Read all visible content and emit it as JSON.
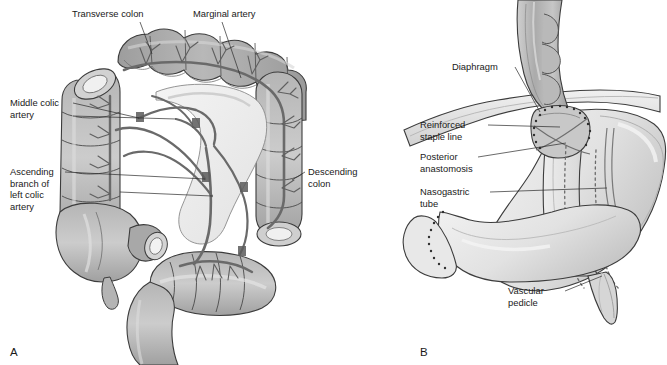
{
  "figure": {
    "background": "#ffffff",
    "ink": "#1a1a1a",
    "type": "medical-anatomical-illustration",
    "style": "grayscale line art, two panels",
    "palette": {
      "bowel_fill": "#a9a9a9",
      "bowel_fill_light": "#c3c3c3",
      "bowel_highlight": "#d8d8d8",
      "lumen": "#efefef",
      "vessel": "#6f6f6f",
      "vessel_dark": "#555555",
      "outline": "#3c3c3c",
      "stomach_fill": "#e6e6e6",
      "stomach_shade": "#c8c8c8",
      "esophagus_fill": "#b4b4b4",
      "leader_line": "#2a2a2a"
    }
  },
  "panels": [
    {
      "id": "A",
      "letter": "A",
      "letter_x": 10,
      "letter_y": 356,
      "subject": "colon-vascular-anatomy",
      "labels": [
        {
          "id": "transverse-colon",
          "lines": [
            "Transverse colon"
          ],
          "text_x": 72,
          "text_y": 17,
          "leader": "M 140 22 L 152 54"
        },
        {
          "id": "marginal-artery",
          "lines": [
            "Marginal artery"
          ],
          "text_x": 193,
          "text_y": 17,
          "leader": "M 222 22 L 241 78"
        },
        {
          "id": "middle-colic-artery",
          "lines": [
            "Middle colic",
            "artery"
          ],
          "text_x": 10,
          "text_y": 106,
          "leader": "M 73 103 L 139 118"
        },
        {
          "id": "middle-colic-artery-second",
          "lines": [],
          "text_x": 0,
          "text_y": 0,
          "leader": "M 73 116 L 176 119"
        },
        {
          "id": "ascending-branch-left-colic-artery",
          "lines": [
            "Ascending",
            "branch of",
            "left colic",
            "artery"
          ],
          "text_x": 10,
          "text_y": 175,
          "leader": "M 65 172 L 205 179"
        },
        {
          "id": "ascending-branch-left-colic-artery-second",
          "lines": [],
          "text_x": 0,
          "text_y": 0,
          "leader": "M 120 192 L 212 196"
        },
        {
          "id": "descending-colon",
          "lines": [
            "Descending",
            "colon"
          ],
          "text_x": 308,
          "text_y": 175,
          "leader": "M 305 172 L 292 180"
        }
      ]
    },
    {
      "id": "B",
      "letter": "B",
      "letter_x": 420,
      "letter_y": 356,
      "subject": "gastric-conduit-esophagogastric-anastomosis",
      "labels": [
        {
          "id": "diaphragm",
          "lines": [
            "Diaphragm"
          ],
          "text_x": 452,
          "text_y": 70,
          "leader": "M 515 67 L 540 112"
        },
        {
          "id": "reinforced-staple-line",
          "lines": [
            "Reinforced",
            "staple line"
          ],
          "text_x": 420,
          "text_y": 128,
          "leader": "M 488 125 L 560 127"
        },
        {
          "id": "posterior-anastomosis",
          "lines": [
            "Posterior",
            "anastomosis"
          ],
          "text_x": 420,
          "text_y": 160,
          "leader": "M 478 157 L 566 143"
        },
        {
          "id": "nasogastric-tube",
          "lines": [
            "Nasogastric",
            "tube"
          ],
          "text_x": 420,
          "text_y": 195,
          "leader": "M 490 192 L 607 188"
        },
        {
          "id": "vascular-pedicle",
          "lines": [
            "Vascular",
            "pedicle"
          ],
          "text_x": 508,
          "text_y": 294,
          "leader": "M 565 291 L 602 276"
        }
      ]
    }
  ]
}
